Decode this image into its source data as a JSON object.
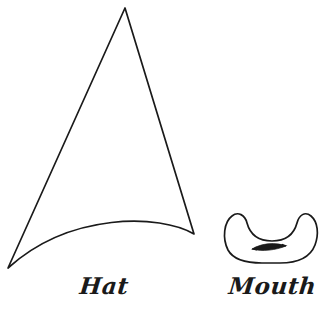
{
  "page": {
    "background_color": "#ffffff",
    "ink_color": "#1a1a1a",
    "width": 331,
    "height": 314
  },
  "figures": [
    {
      "id": "hat",
      "label": "Hat",
      "shape": "witch-hat-triangle-with-curved-brim",
      "outline_color": "#1a1a1a",
      "fill_color": "#ffffff",
      "stroke_width": 1.6,
      "apex": {
        "x": 125,
        "y": 8
      },
      "bottom_left_tip": {
        "x": 8,
        "y": 268
      },
      "bottom_right_tip": {
        "x": 194,
        "y": 234
      },
      "brim_curve_peak": {
        "x": 112,
        "y": 218
      }
    },
    {
      "id": "mouth",
      "label": "Mouth",
      "shape": "crescent-banana",
      "outline_color": "#1a1a1a",
      "fill_color": "#ffffff",
      "stroke_width": 1.6,
      "bounds": {
        "x": 222,
        "y": 213,
        "width": 96,
        "height": 50
      },
      "inner_marker": {
        "name": "double-headed-arrow",
        "from": {
          "x": 252,
          "y": 249
        },
        "to": {
          "x": 286,
          "y": 246
        }
      }
    }
  ],
  "labels": {
    "hat": "Hat",
    "mouth": "Mouth"
  }
}
